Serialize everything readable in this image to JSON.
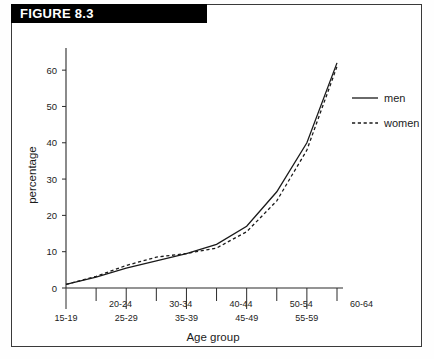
{
  "figure": {
    "banner_label": "FIGURE 8.3"
  },
  "chart_data": {
    "type": "line",
    "title": "",
    "xlabel": "Age group",
    "ylabel": "percentage",
    "categories": [
      "15-19",
      "20-24",
      "25-29",
      "30-34",
      "35-39",
      "40-44",
      "45-49",
      "50-54",
      "55-59",
      "60-64"
    ],
    "ylim": [
      0,
      65
    ],
    "yticks": [
      0,
      10,
      20,
      30,
      40,
      50,
      60
    ],
    "ytick_labels": [
      "0",
      "10",
      "20",
      "30",
      "40",
      "50",
      "60"
    ],
    "grid": false,
    "legend_position": "right",
    "series": [
      {
        "name": "men",
        "style": "solid",
        "values": [
          1,
          3,
          5.5,
          7.5,
          9.5,
          12,
          17,
          26.5,
          40,
          62
        ]
      },
      {
        "name": "women",
        "style": "dashed",
        "values": [
          1,
          3.2,
          6.2,
          8.5,
          9.5,
          11,
          15.5,
          24,
          38,
          61
        ]
      }
    ],
    "xtick_labels_upper": [
      "20-24",
      "30-34",
      "40-44",
      "50-54",
      "60-64"
    ],
    "xtick_labels_lower": [
      "15-19",
      "25-29",
      "35-39",
      "45-49",
      "55-59"
    ]
  }
}
